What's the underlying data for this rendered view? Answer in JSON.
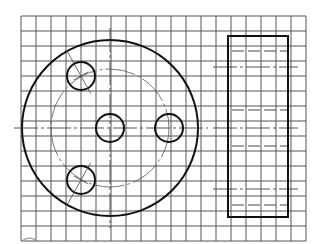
{
  "drawing": {
    "title": "",
    "type": "orthographic-views-on-grid",
    "colors": {
      "line": "#111111",
      "grid": "#555555",
      "background": "#ffffff"
    },
    "grid": {
      "x0": 21,
      "y0": 16,
      "cols": 19,
      "rows": 15,
      "step": 15
    },
    "front_view": {
      "outer_circle": {
        "cx": 110,
        "cy": 128,
        "r": 88
      },
      "pitch_circle": {
        "cx": 110,
        "cy": 128,
        "r": 59
      },
      "holes": [
        {
          "name": "center",
          "cx": 110,
          "cy": 128,
          "r": 14
        },
        {
          "name": "right",
          "cx": 169,
          "cy": 128,
          "r": 14
        },
        {
          "name": "upper-left",
          "cx": 81,
          "cy": 76,
          "r": 14
        },
        {
          "name": "lower-left",
          "cx": 81,
          "cy": 180,
          "r": 14
        }
      ]
    },
    "side_view": {
      "rect": {
        "x": 228,
        "y": 36,
        "w": 60,
        "h": 181
      },
      "hidden_lines_y": [
        51,
        110,
        146,
        205
      ],
      "center_lines_y": [
        67,
        128,
        189
      ]
    }
  }
}
